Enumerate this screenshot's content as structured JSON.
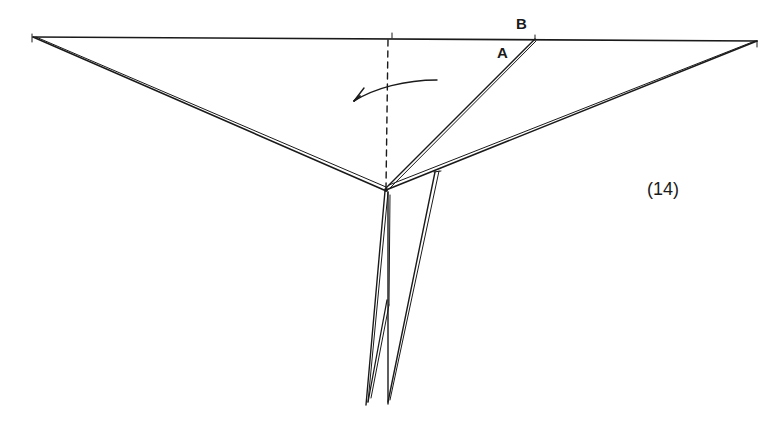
{
  "diagram": {
    "type": "origami-fold-diagram",
    "step_label": "(14)",
    "point_labels": {
      "a": "A",
      "b": "B"
    },
    "elements": {
      "top_edge": "horizontal-edge",
      "center_crease": "valley-fold-dashed",
      "fold_arrow": "curved-arrow-left",
      "left_flap": "triangle-left",
      "right_flap": "triangle-right",
      "inner_flap_edge": "edge-A-to-B",
      "legs": "two-narrow-points-down"
    },
    "colors": {
      "ink": "#1a1a1a",
      "background": "#ffffff"
    }
  }
}
